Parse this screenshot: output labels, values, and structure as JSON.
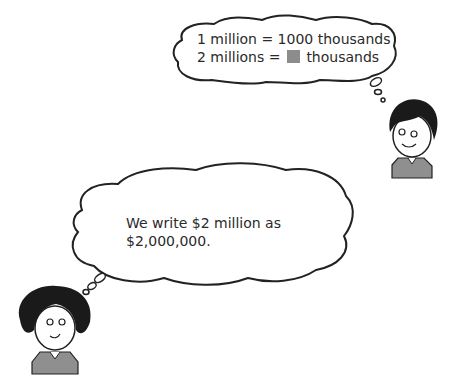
{
  "top_bubble": {
    "line1": "1 million = 1000 thousands",
    "line2_prefix": "2 millions =",
    "line2_suffix": "thousands",
    "blank_color": "#8c8c8c"
  },
  "bottom_bubble": {
    "line1": "We write $2 million as",
    "line2": "$2,000,000."
  },
  "characters": {
    "boy": "boy-character",
    "girl": "girl-character"
  }
}
